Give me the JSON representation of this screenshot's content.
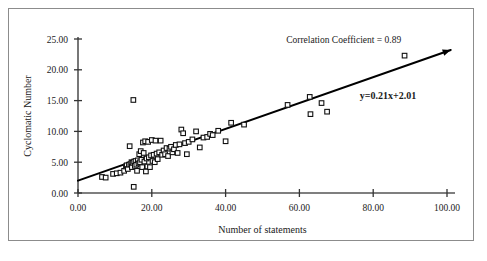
{
  "chart_data": {
    "type": "scatter",
    "title": "",
    "xlabel": "Number of statements",
    "ylabel": "Cyclomatic Number",
    "xlim": [
      0,
      100
    ],
    "ylim": [
      0,
      25
    ],
    "xticks": [
      0,
      20,
      40,
      60,
      80,
      100
    ],
    "yticks": [
      0,
      5,
      10,
      15,
      20,
      25
    ],
    "xtick_labels": [
      "0.00",
      "20.00",
      "40.00",
      "60.00",
      "80.00",
      "100.00"
    ],
    "ytick_labels": [
      "0.00",
      "5.00",
      "10.00",
      "15.00",
      "20.00",
      "25.00"
    ],
    "grid": false,
    "legend": "none",
    "annotations": [
      {
        "name": "correlation-coefficient",
        "text": "Correlation Coefficient = 0.89",
        "x": 72,
        "y": 24.3,
        "bold": false
      },
      {
        "name": "regression-equation",
        "text": "y=0.21x+2.01",
        "x": 84,
        "y": 15.2,
        "bold": true
      }
    ],
    "trendline": {
      "name": "linear-regression-line",
      "equation": "y=0.21x+2.01",
      "slope": 0.21,
      "intercept": 2.01,
      "x_start": 0,
      "x_end": 101,
      "arrow_end": true
    },
    "series": [
      {
        "name": "Modules",
        "marker": "open-square",
        "points": [
          [
            6.5,
            2.6
          ],
          [
            7.5,
            2.5
          ],
          [
            9.5,
            3.1
          ],
          [
            10.5,
            3.2
          ],
          [
            11.5,
            3.3
          ],
          [
            12.5,
            3.6
          ],
          [
            13.0,
            4.3
          ],
          [
            13.2,
            4.5
          ],
          [
            13.5,
            3.9
          ],
          [
            13.8,
            4.6
          ],
          [
            14.0,
            7.6
          ],
          [
            14.2,
            4.7
          ],
          [
            14.5,
            5.0
          ],
          [
            14.6,
            4.2
          ],
          [
            14.8,
            4.9
          ],
          [
            15.0,
            15.1
          ],
          [
            15.1,
            1.0
          ],
          [
            15.2,
            5.1
          ],
          [
            15.4,
            4.4
          ],
          [
            15.6,
            5.2
          ],
          [
            15.8,
            4.6
          ],
          [
            16.0,
            3.6
          ],
          [
            16.2,
            5.3
          ],
          [
            16.4,
            4.8
          ],
          [
            16.6,
            6.3
          ],
          [
            16.8,
            5.0
          ],
          [
            17.0,
            6.8
          ],
          [
            17.2,
            5.4
          ],
          [
            17.4,
            4.2
          ],
          [
            17.6,
            8.2
          ],
          [
            17.8,
            6.5
          ],
          [
            18.0,
            5.1
          ],
          [
            18.2,
            8.4
          ],
          [
            18.4,
            3.5
          ],
          [
            18.6,
            5.6
          ],
          [
            18.8,
            4.3
          ],
          [
            19.0,
            8.3
          ],
          [
            19.2,
            5.8
          ],
          [
            19.5,
            4.2
          ],
          [
            19.8,
            6.1
          ],
          [
            20.0,
            8.6
          ],
          [
            20.2,
            5.2
          ],
          [
            20.5,
            6.2
          ],
          [
            20.8,
            5.0
          ],
          [
            21.0,
            8.5
          ],
          [
            21.3,
            6.4
          ],
          [
            21.6,
            5.5
          ],
          [
            22.0,
            6.6
          ],
          [
            22.4,
            8.5
          ],
          [
            22.8,
            6.2
          ],
          [
            23.2,
            6.9
          ],
          [
            23.6,
            6.3
          ],
          [
            24.0,
            7.3
          ],
          [
            24.4,
            6.0
          ],
          [
            24.8,
            7.2
          ],
          [
            25.2,
            7.5
          ],
          [
            25.6,
            6.6
          ],
          [
            26.0,
            7.1
          ],
          [
            26.5,
            7.8
          ],
          [
            27.0,
            6.5
          ],
          [
            27.5,
            7.9
          ],
          [
            28.0,
            10.3
          ],
          [
            28.5,
            9.7
          ],
          [
            29.0,
            8.1
          ],
          [
            29.5,
            6.3
          ],
          [
            30.0,
            8.3
          ],
          [
            31.0,
            8.7
          ],
          [
            32.0,
            10.0
          ],
          [
            33.0,
            7.4
          ],
          [
            34.0,
            9.0
          ],
          [
            35.0,
            9.1
          ],
          [
            35.8,
            9.6
          ],
          [
            36.5,
            9.4
          ],
          [
            38.0,
            10.1
          ],
          [
            40.0,
            8.4
          ],
          [
            41.5,
            11.4
          ],
          [
            45.0,
            11.1
          ],
          [
            56.8,
            14.3
          ],
          [
            62.8,
            15.6
          ],
          [
            63.0,
            12.8
          ],
          [
            66.0,
            14.6
          ],
          [
            67.5,
            13.2
          ],
          [
            88.5,
            22.3
          ]
        ]
      }
    ]
  }
}
